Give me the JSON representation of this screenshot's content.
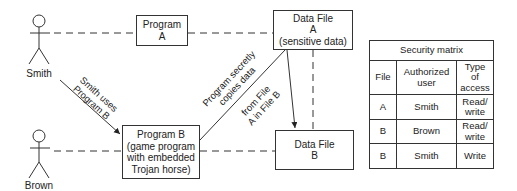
{
  "actors": [
    {
      "name": "Smith"
    },
    {
      "name": "Brown"
    }
  ],
  "boxes": {
    "program_a": {
      "lines": [
        "Program",
        "A"
      ]
    },
    "program_b": {
      "lines": [
        "Program B",
        "(game program",
        "with embedded",
        "Trojan horse)"
      ]
    },
    "data_file_a": {
      "lines": [
        "Data File",
        "A",
        "(sensitive data)"
      ]
    },
    "data_file_b": {
      "lines": [
        "Data File",
        "B"
      ]
    }
  },
  "annotations": {
    "smith_uses": {
      "lines": [
        "Smith uses",
        "Program B"
      ]
    },
    "secretly_copies": {
      "lines": [
        "Program secretly",
        "copies data"
      ]
    },
    "from_file": {
      "lines": [
        "from File",
        "A in File B"
      ]
    }
  },
  "security_matrix": {
    "title": "Security matrix",
    "headers": [
      [
        "File"
      ],
      [
        "Authorized",
        "user"
      ],
      [
        "Type",
        "of",
        "access"
      ]
    ],
    "rows": [
      {
        "file": "A",
        "user": "Smith",
        "access": [
          "Read/",
          "write"
        ]
      },
      {
        "file": "B",
        "user": "Brown",
        "access": [
          "Read/",
          "write"
        ]
      },
      {
        "file": "B",
        "user": "Smith",
        "access": [
          "Write"
        ]
      }
    ]
  }
}
